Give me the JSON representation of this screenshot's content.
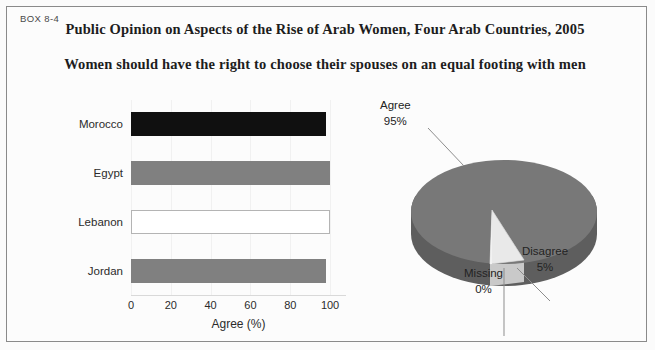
{
  "box": {
    "label": "BOX 8-4",
    "title": "Public Opinion on Aspects of the Rise of Arab Women, Four Arab Countries, 2005",
    "subtitle": "Women should have the right to choose their spouses on an equal footing with men"
  },
  "colors": {
    "bar_gray": "#808080",
    "bar_black": "#101010",
    "bar_white": "#ffffff",
    "bar_white_border": "#b4b4b4",
    "pie_top": "#787878",
    "pie_side": "#606060",
    "pie_light": "#e6e6e6",
    "pie_light_side": "#c8c8c8",
    "frame": "#8a8a8a",
    "grid": "#f1f1f1",
    "text": "#232323"
  },
  "chart_data": [
    {
      "type": "bar",
      "orientation": "horizontal",
      "title": "",
      "xlabel": "Agree (%)",
      "ylabel": "",
      "categories": [
        "Morocco",
        "Egypt",
        "Lebanon",
        "Jordan"
      ],
      "values": [
        98,
        100,
        100,
        98
      ],
      "bar_fills": [
        "#101010",
        "#808080",
        "#ffffff",
        "#808080"
      ],
      "xlim": [
        0,
        108
      ],
      "xticks": [
        0,
        20,
        40,
        60,
        80,
        100
      ],
      "xtick_labels": [
        "0",
        "20",
        "40",
        "60",
        "80",
        "100"
      ],
      "grid": true,
      "legend": "none"
    },
    {
      "type": "pie",
      "title": "",
      "three_d": true,
      "labels": [
        "Agree",
        "Disagree",
        "Missing"
      ],
      "values": [
        95,
        5,
        0
      ],
      "value_labels": [
        "95%",
        "5%",
        "0%"
      ],
      "slice_colors": [
        "#787878",
        "#e6e6e6",
        "#e6e6e6"
      ],
      "legend": "callout-labels"
    }
  ],
  "bar_chart": {
    "axis_title": "Agree (%)",
    "ticks": [
      "0",
      "20",
      "40",
      "60",
      "80",
      "100"
    ],
    "rows": [
      {
        "label": "Morocco",
        "value": 98,
        "fill": "#101010",
        "border": "none"
      },
      {
        "label": "Egypt",
        "value": 100,
        "fill": "#808080",
        "border": "none"
      },
      {
        "label": "Lebanon",
        "value": 100,
        "fill": "#ffffff",
        "border": "#b4b4b4"
      },
      {
        "label": "Jordan",
        "value": 98,
        "fill": "#808080",
        "border": "none"
      }
    ]
  },
  "pie_chart": {
    "agree_label": "Agree",
    "agree_value": "95%",
    "disagree_label": "Disagree",
    "disagree_value": "5%",
    "missing_label": "Missing",
    "missing_value": "0%"
  }
}
